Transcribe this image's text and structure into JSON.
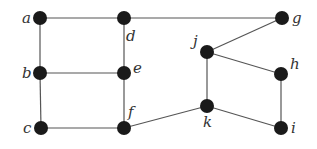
{
  "diagram": {
    "type": "undirected-graph",
    "nodes": [
      {
        "id": "a",
        "label": "a"
      },
      {
        "id": "b",
        "label": "b"
      },
      {
        "id": "c",
        "label": "c"
      },
      {
        "id": "d",
        "label": "d"
      },
      {
        "id": "e",
        "label": "e"
      },
      {
        "id": "f",
        "label": "f"
      },
      {
        "id": "g",
        "label": "g"
      },
      {
        "id": "h",
        "label": "h"
      },
      {
        "id": "i",
        "label": "i"
      },
      {
        "id": "j",
        "label": "j"
      },
      {
        "id": "k",
        "label": "k"
      }
    ],
    "edges": [
      [
        "a",
        "d"
      ],
      [
        "d",
        "g"
      ],
      [
        "a",
        "b"
      ],
      [
        "b",
        "c"
      ],
      [
        "d",
        "e"
      ],
      [
        "e",
        "f"
      ],
      [
        "b",
        "e"
      ],
      [
        "c",
        "f"
      ],
      [
        "f",
        "k"
      ],
      [
        "g",
        "j"
      ],
      [
        "j",
        "h"
      ],
      [
        "j",
        "k"
      ],
      [
        "h",
        "i"
      ],
      [
        "k",
        "i"
      ]
    ],
    "colors": {
      "node": "#1a1a1a",
      "edge": "#555555",
      "label": "#333333"
    }
  }
}
